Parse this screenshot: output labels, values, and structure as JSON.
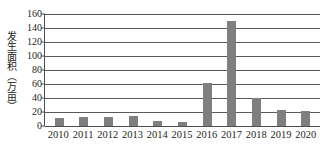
{
  "chart_data": {
    "type": "bar",
    "title": "",
    "xlabel": "",
    "ylabel": "发生面积（万亩）",
    "categories": [
      "2010",
      "2011",
      "2012",
      "2013",
      "2014",
      "2015",
      "2016",
      "2017",
      "2018",
      "2019",
      "2020"
    ],
    "values": [
      12,
      12.5,
      12.5,
      14,
      7,
      5.5,
      62,
      150,
      40,
      23,
      21.5
    ],
    "ylim": [
      0,
      160
    ],
    "ytick_labels": [
      "0",
      "20",
      "40",
      "60",
      "80",
      "100",
      "120",
      "140",
      "160"
    ],
    "ytick_values": [
      0,
      20,
      40,
      60,
      80,
      100,
      120,
      140,
      160
    ],
    "grid": true,
    "legend": "none",
    "series": [
      {
        "name": "发生面积",
        "color": "#7f7f7f",
        "values": [
          12,
          12.5,
          12.5,
          14,
          7,
          5.5,
          62,
          150,
          40,
          23,
          21.5
        ]
      }
    ]
  },
  "colors": {
    "bar": "#7f7f7f",
    "gridline": "#595959",
    "axis": "#4d4d4d",
    "text": "#231f20",
    "background": "#ffffff"
  }
}
